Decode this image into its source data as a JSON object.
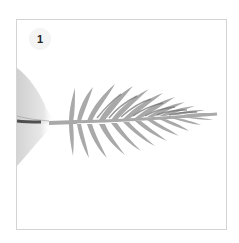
{
  "step": {
    "number": "1"
  },
  "illustration": {
    "subject": "hand holding paper palm leaf by stem",
    "leaf_color": "#a9a9a9",
    "leaf_shadow_color": "#8a8a8a",
    "hand_color": "#d9d9d9",
    "frame_border_color": "#d4d4d4"
  }
}
